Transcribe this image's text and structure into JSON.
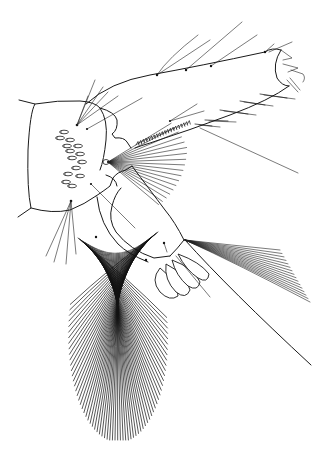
{
  "figure": {
    "title": "",
    "style": {
      "background": "#ffffff",
      "ink": "#1a1a1a"
    },
    "parts": {
      "basal_segment": "rounded rectangular head capsule (left)",
      "distal_segment": "elongated tapering segment extending to upper right",
      "apex": "bifid tip with small claws (upper right)",
      "comb_row": "row of small spines along lower margin of distal segment",
      "fan_small": "radiating fan of fine setae from a socket near center",
      "middle_segment": "rounded lobed segment below center",
      "petals": "four leaf-like lobes",
      "brush_large": "large dense brush of long setae (lower left)",
      "brush_right": "fan of setae and long bristle (lower right)"
    },
    "counts": {
      "sensilla_ovals": 14,
      "small_fan_setae": 18,
      "large_brush_setae": 70,
      "right_brush_setae": 16,
      "petal_lobes": 4
    }
  }
}
